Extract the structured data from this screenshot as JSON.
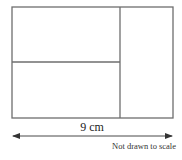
{
  "diagram": {
    "type": "rectangle-partition",
    "colors": {
      "stroke": "#6e6e6e",
      "arrow": "#333333",
      "text": "#222222",
      "background": "#ffffff"
    },
    "outer_rectangle": {
      "x": 12,
      "y": 7,
      "width": 161,
      "height": 111
    },
    "regions": [
      {
        "id": "top-left",
        "x": 12,
        "y": 7,
        "width": 108,
        "height": 55
      },
      {
        "id": "bottom-left",
        "x": 12,
        "y": 62,
        "width": 108,
        "height": 56
      },
      {
        "id": "right",
        "x": 120,
        "y": 7,
        "width": 53,
        "height": 111
      }
    ],
    "dimension": {
      "label": "9 cm",
      "x1": 12,
      "x2": 173,
      "y": 136
    },
    "note": "Not drawn to scale"
  }
}
